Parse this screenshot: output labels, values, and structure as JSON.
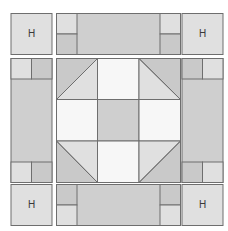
{
  "diagram": {
    "title": "",
    "corner_label": "H",
    "corners": [
      {
        "position": "top-left",
        "label": "H"
      },
      {
        "position": "top-right",
        "label": "H"
      },
      {
        "position": "bottom-left",
        "label": "H"
      },
      {
        "position": "bottom-right",
        "label": "H"
      }
    ],
    "colors": {
      "light": "#e0e0e0",
      "medium": "#cfcfcf",
      "dark": "#c4c4c4",
      "white": "#f7f7f7",
      "stroke": "#6e6e6e"
    }
  }
}
